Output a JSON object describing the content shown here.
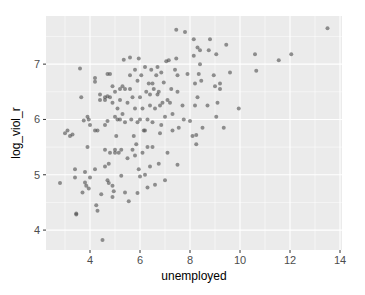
{
  "chart_data": {
    "type": "scatter",
    "title": "",
    "xlabel": "unemployed",
    "ylabel": "log_viol_r",
    "xlim": [
      2.24,
      14.08
    ],
    "ylim": [
      3.64,
      7.87
    ],
    "x_ticks": [
      4,
      6,
      8,
      10,
      12,
      14
    ],
    "y_ticks": [
      4,
      5,
      6,
      7
    ],
    "x_tick_labels": [
      "4",
      "6",
      "8",
      "10",
      "12",
      "14"
    ],
    "y_tick_labels": [
      "4",
      "5",
      "6",
      "7"
    ],
    "grid": true,
    "legend": null,
    "point_color": "#4d4d4d",
    "point_alpha": 0.6,
    "panel_background": "#ebebeb",
    "grid_color": "#ffffff",
    "points": [
      [
        2.8,
        4.85
      ],
      [
        3.0,
        5.75
      ],
      [
        3.1,
        5.8
      ],
      [
        3.2,
        5.7
      ],
      [
        3.3,
        5.73
      ],
      [
        3.4,
        5.1
      ],
      [
        3.4,
        4.95
      ],
      [
        3.45,
        4.3
      ],
      [
        3.45,
        4.28
      ],
      [
        3.6,
        6.92
      ],
      [
        3.65,
        6.4
      ],
      [
        3.7,
        4.68
      ],
      [
        3.75,
        5.98
      ],
      [
        3.8,
        5.05
      ],
      [
        3.8,
        4.86
      ],
      [
        3.85,
        4.8
      ],
      [
        3.9,
        5.5
      ],
      [
        3.9,
        6.05
      ],
      [
        3.95,
        6.0
      ],
      [
        3.95,
        4.75
      ],
      [
        4.0,
        4.95
      ],
      [
        4.0,
        5.9
      ],
      [
        4.2,
        6.75
      ],
      [
        4.2,
        6.68
      ],
      [
        4.2,
        5.8
      ],
      [
        4.2,
        5.1
      ],
      [
        4.25,
        4.45
      ],
      [
        4.3,
        4.35
      ],
      [
        4.3,
        5.8
      ],
      [
        4.4,
        6.45
      ],
      [
        4.4,
        6.35
      ],
      [
        4.45,
        4.65
      ],
      [
        4.5,
        3.82
      ],
      [
        4.6,
        6.35
      ],
      [
        4.6,
        6.4
      ],
      [
        4.6,
        5.9
      ],
      [
        4.6,
        5.45
      ],
      [
        4.6,
        5.15
      ],
      [
        4.7,
        6.82
      ],
      [
        4.7,
        6.42
      ],
      [
        4.7,
        5.97
      ],
      [
        4.7,
        4.9
      ],
      [
        4.75,
        4.85
      ],
      [
        4.75,
        5.2
      ],
      [
        4.8,
        6.82
      ],
      [
        4.8,
        6.4
      ],
      [
        4.8,
        5.4
      ],
      [
        4.9,
        6.6
      ],
      [
        4.9,
        6.3
      ],
      [
        4.9,
        4.8
      ],
      [
        4.9,
        4.6
      ],
      [
        4.95,
        4.7
      ],
      [
        5.0,
        6.5
      ],
      [
        5.0,
        6.05
      ],
      [
        5.0,
        5.45
      ],
      [
        5.0,
        5.4
      ],
      [
        5.05,
        5.7
      ],
      [
        5.1,
        6.2
      ],
      [
        5.1,
        6.0
      ],
      [
        5.15,
        5.4
      ],
      [
        5.2,
        6.55
      ],
      [
        5.2,
        6.0
      ],
      [
        5.2,
        6.35
      ],
      [
        5.25,
        5.45
      ],
      [
        5.25,
        4.98
      ],
      [
        5.3,
        6.1
      ],
      [
        5.3,
        6.6
      ],
      [
        5.35,
        7.08
      ],
      [
        5.4,
        6.55
      ],
      [
        5.4,
        5.95
      ],
      [
        5.4,
        4.68
      ],
      [
        5.5,
        6.3
      ],
      [
        5.5,
        5.3
      ],
      [
        5.55,
        4.52
      ],
      [
        5.6,
        7.12
      ],
      [
        5.6,
        6.8
      ],
      [
        5.6,
        6.55
      ],
      [
        5.65,
        6.0
      ],
      [
        5.7,
        6.4
      ],
      [
        5.7,
        5.45
      ],
      [
        5.75,
        5.7
      ],
      [
        5.8,
        6.2
      ],
      [
        5.8,
        5.35
      ],
      [
        5.8,
        6.9
      ],
      [
        5.85,
        5.55
      ],
      [
        5.9,
        6.7
      ],
      [
        5.9,
        5.95
      ],
      [
        5.9,
        4.67
      ],
      [
        5.95,
        7.1
      ],
      [
        5.95,
        5.1
      ],
      [
        6.0,
        6.0
      ],
      [
        6.0,
        6.4
      ],
      [
        6.0,
        4.97
      ],
      [
        6.05,
        6.8
      ],
      [
        6.1,
        6.2
      ],
      [
        6.1,
        5.4
      ],
      [
        6.15,
        5.8
      ],
      [
        6.2,
        6.95
      ],
      [
        6.2,
        5.8
      ],
      [
        6.2,
        5.0
      ],
      [
        6.25,
        6.5
      ],
      [
        6.3,
        6.0
      ],
      [
        6.3,
        5.5
      ],
      [
        6.3,
        4.77
      ],
      [
        6.35,
        6.65
      ],
      [
        6.4,
        6.45
      ],
      [
        6.4,
        6.25
      ],
      [
        6.4,
        5.15
      ],
      [
        6.45,
        6.9
      ],
      [
        6.5,
        6.65
      ],
      [
        6.5,
        5.95
      ],
      [
        6.5,
        5.5
      ],
      [
        6.55,
        6.55
      ],
      [
        6.6,
        6.2
      ],
      [
        6.6,
        4.82
      ],
      [
        6.65,
        6.8
      ],
      [
        6.7,
        6.45
      ],
      [
        6.7,
        6.95
      ],
      [
        6.75,
        6.5
      ],
      [
        6.75,
        5.2
      ],
      [
        6.8,
        6.25
      ],
      [
        6.8,
        5.75
      ],
      [
        6.85,
        5.9
      ],
      [
        6.85,
        6.85
      ],
      [
        6.9,
        6.3
      ],
      [
        6.95,
        6.67
      ],
      [
        7.0,
        4.9
      ],
      [
        7.0,
        6.05
      ],
      [
        7.05,
        7.05
      ],
      [
        7.1,
        6.35
      ],
      [
        7.1,
        5.4
      ],
      [
        7.15,
        7.07
      ],
      [
        7.2,
        6.3
      ],
      [
        7.25,
        6.55
      ],
      [
        7.3,
        5.8
      ],
      [
        7.3,
        6.1
      ],
      [
        7.4,
        6.9
      ],
      [
        7.45,
        7.62
      ],
      [
        7.45,
        7.1
      ],
      [
        7.5,
        6.8
      ],
      [
        7.5,
        6.5
      ],
      [
        7.5,
        5.18
      ],
      [
        7.55,
        5.85
      ],
      [
        7.7,
        6.25
      ],
      [
        7.75,
        6.0
      ],
      [
        7.8,
        7.58
      ],
      [
        7.9,
        6.82
      ],
      [
        8.0,
        5.97
      ],
      [
        8.1,
        5.7
      ],
      [
        8.15,
        7.45
      ],
      [
        8.15,
        7.15
      ],
      [
        8.2,
        6.65
      ],
      [
        8.2,
        6.25
      ],
      [
        8.25,
        5.72
      ],
      [
        8.25,
        5.55
      ],
      [
        8.3,
        7.3
      ],
      [
        8.3,
        6.4
      ],
      [
        8.35,
        6.82
      ],
      [
        8.4,
        7.0
      ],
      [
        8.4,
        7.25
      ],
      [
        8.45,
        6.7
      ],
      [
        8.5,
        5.85
      ],
      [
        8.7,
        6.25
      ],
      [
        8.75,
        7.25
      ],
      [
        8.8,
        7.45
      ],
      [
        8.95,
        6.8
      ],
      [
        9.0,
        6.6
      ],
      [
        9.05,
        6.05
      ],
      [
        9.05,
        7.18
      ],
      [
        9.1,
        6.3
      ],
      [
        9.2,
        6.65
      ],
      [
        9.2,
        6.55
      ],
      [
        9.35,
        5.85
      ],
      [
        9.45,
        7.35
      ],
      [
        9.6,
        6.85
      ],
      [
        9.95,
        6.2
      ],
      [
        10.6,
        7.18
      ],
      [
        10.65,
        6.88
      ],
      [
        11.55,
        7.07
      ],
      [
        12.05,
        7.18
      ],
      [
        13.5,
        7.65
      ]
    ]
  }
}
